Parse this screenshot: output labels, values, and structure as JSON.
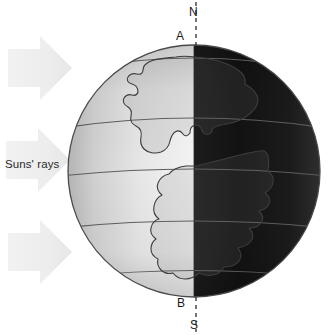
{
  "figure": {
    "type": "labelled-diagram",
    "background_color": "#ffffff"
  },
  "labels": {
    "north_pole": "N",
    "point_a": "A",
    "point_b": "B",
    "south_pole": "S",
    "suns_rays": "Suns' rays"
  },
  "globe": {
    "center_x": 194,
    "center_y": 171,
    "radius": 126,
    "outline_color": "#4a4a4a",
    "lit_side": "left",
    "dark_side": "right",
    "lit_fill_light": "#ffffff",
    "lit_fill_edge": "#b9b9b9",
    "dark_fill_near": "#4d4d4d",
    "dark_fill_far": "#0d0d0d",
    "terminator_x": 194,
    "latitude_line_color": "#5a5a5a",
    "latitude_lines_y": [
      63,
      123,
      172,
      223,
      273
    ],
    "latitude_line_count": 5,
    "continent_outline_color": "#3c3c3c",
    "continent_count": 2
  },
  "axis": {
    "style": "dashed",
    "color": "#2b2b2b",
    "x": 196,
    "top_y": 2,
    "bottom_y": 332,
    "dash": "4 4"
  },
  "sun_arrows": {
    "direction": "right",
    "count": 3,
    "fill_color": "#f0f0f0",
    "items": [
      {
        "name": "top-arrow",
        "y": 38
      },
      {
        "name": "middle-arrow",
        "y": 130
      },
      {
        "name": "bottom-arrow",
        "y": 222
      }
    ]
  }
}
